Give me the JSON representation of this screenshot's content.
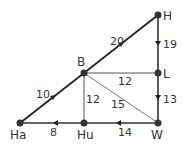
{
  "nodes": [
    {
      "id": "H",
      "label": "H",
      "x": 158,
      "y": 15
    },
    {
      "id": "L",
      "label": "L",
      "x": 158,
      "y": 73
    },
    {
      "id": "W",
      "label": "W",
      "x": 158,
      "y": 123
    },
    {
      "id": "B",
      "label": "B",
      "x": 84,
      "y": 73
    },
    {
      "id": "Hu",
      "label": "Hu",
      "x": 84,
      "y": 123
    },
    {
      "id": "Ha",
      "label": "Ha",
      "x": 20,
      "y": 123
    }
  ],
  "edges": [
    {
      "from": "Ha",
      "to": "B",
      "weight": "10",
      "directed": true
    },
    {
      "from": "B",
      "to": "H",
      "weight": "20",
      "directed": true
    },
    {
      "from": "H",
      "to": "L",
      "weight": "19",
      "directed": true
    },
    {
      "from": "L",
      "to": "W",
      "weight": "13",
      "directed": true
    },
    {
      "from": "W",
      "to": "Hu",
      "weight": "14",
      "directed": true
    },
    {
      "from": "Hu",
      "to": "Ha",
      "weight": "8",
      "directed": true
    },
    {
      "from": "B",
      "to": "L",
      "weight": "12",
      "directed": false
    },
    {
      "from": "B",
      "to": "Hu",
      "weight": "12",
      "directed": false
    },
    {
      "from": "B",
      "to": "W",
      "weight": "15",
      "directed": false
    }
  ]
}
